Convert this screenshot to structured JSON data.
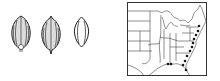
{
  "figure": {
    "seeds": [
      {
        "name": "grain-dorsal-view",
        "cx": 20,
        "cy": 32
      },
      {
        "name": "grain-ventral-view",
        "cx": 50,
        "cy": 33
      },
      {
        "name": "grain-side-view",
        "cx": 81,
        "cy": 30
      }
    ],
    "map": {
      "region": "eastern-united-states",
      "occurrence_dots": [
        {
          "x": 78,
          "y": 23
        },
        {
          "x": 75,
          "y": 27
        },
        {
          "x": 73,
          "y": 31
        },
        {
          "x": 71,
          "y": 35
        },
        {
          "x": 69,
          "y": 39
        },
        {
          "x": 68,
          "y": 44
        },
        {
          "x": 66,
          "y": 48
        },
        {
          "x": 63,
          "y": 52
        },
        {
          "x": 60,
          "y": 57
        },
        {
          "x": 57,
          "y": 61
        },
        {
          "x": 45,
          "y": 61
        },
        {
          "x": 49,
          "y": 61
        },
        {
          "x": 58,
          "y": 66
        }
      ],
      "dot_color": "#1a1a1a",
      "line_color": "#333333"
    }
  }
}
